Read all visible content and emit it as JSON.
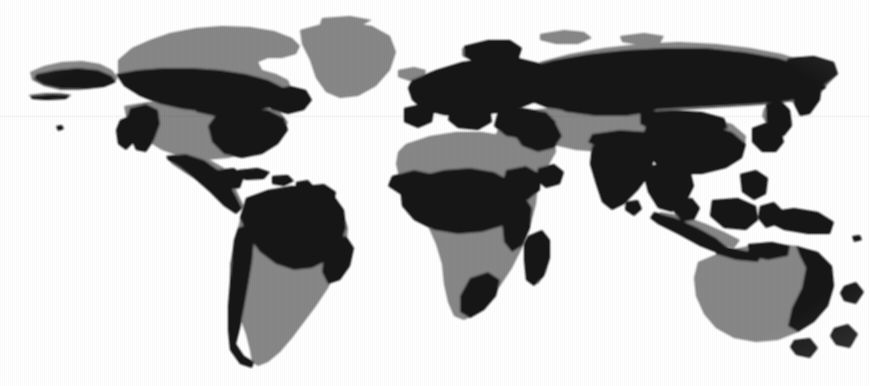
{
  "figure": {
    "width": 870,
    "height": 386,
    "background_color": "#ffffff",
    "base_land_color": "#878787",
    "accent_region_color": "#161616",
    "projection": "equirectangular"
  },
  "map": {
    "legend_note": "",
    "scanline": {
      "present": true,
      "y": 115,
      "color": "#e8e8e8"
    },
    "continents": [
      {
        "name": "north-america",
        "base_shade": "gray",
        "accent_shade": "black"
      },
      {
        "name": "south-america",
        "base_shade": "gray",
        "accent_shade": "black"
      },
      {
        "name": "greenland",
        "base_shade": "gray",
        "accent_shade": "none"
      },
      {
        "name": "europe",
        "base_shade": "gray",
        "accent_shade": "black"
      },
      {
        "name": "africa",
        "base_shade": "gray",
        "accent_shade": "black"
      },
      {
        "name": "asia",
        "base_shade": "gray",
        "accent_shade": "black"
      },
      {
        "name": "australia",
        "base_shade": "gray",
        "accent_shade": "black"
      },
      {
        "name": "southeast-asia-islands",
        "base_shade": "gray",
        "accent_shade": "black"
      },
      {
        "name": "madagascar",
        "base_shade": "gray",
        "accent_shade": "black"
      },
      {
        "name": "new-zealand",
        "base_shade": "gray",
        "accent_shade": "black"
      },
      {
        "name": "japan",
        "base_shade": "gray",
        "accent_shade": "black"
      },
      {
        "name": "british-isles",
        "base_shade": "gray",
        "accent_shade": "black"
      }
    ]
  }
}
